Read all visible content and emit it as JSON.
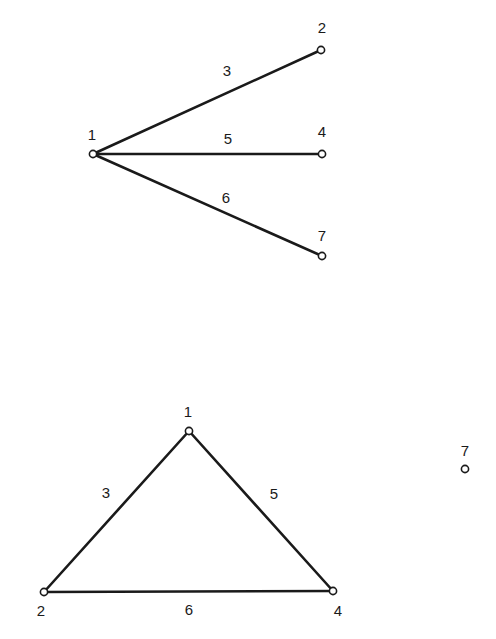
{
  "graphs": [
    {
      "name": "star-graph",
      "nodes": [
        {
          "id": "1",
          "x": 93,
          "y": 154,
          "lx": 92,
          "ly": 140
        },
        {
          "id": "2",
          "x": 321,
          "y": 50,
          "lx": 322,
          "ly": 33
        },
        {
          "id": "4",
          "x": 322,
          "y": 154,
          "lx": 322,
          "ly": 137
        },
        {
          "id": "7",
          "x": 322,
          "y": 256,
          "lx": 322,
          "ly": 241
        }
      ],
      "edges": [
        {
          "label": "3",
          "from": "1",
          "to": "2",
          "lx": 227,
          "ly": 76
        },
        {
          "label": "5",
          "from": "1",
          "to": "4",
          "lx": 228,
          "ly": 144
        },
        {
          "label": "6",
          "from": "1",
          "to": "7",
          "lx": 226,
          "ly": 203
        }
      ]
    },
    {
      "name": "triangle-graph",
      "nodes": [
        {
          "id": "1",
          "x": 189,
          "y": 431,
          "lx": 188,
          "ly": 417
        },
        {
          "id": "2",
          "x": 44,
          "y": 592,
          "lx": 41,
          "ly": 616
        },
        {
          "id": "4",
          "x": 333,
          "y": 591,
          "lx": 338,
          "ly": 616
        },
        {
          "id": "7",
          "x": 465,
          "y": 469,
          "lx": 465,
          "ly": 456
        }
      ],
      "edges": [
        {
          "label": "3",
          "from": "1",
          "to": "2",
          "lx": 106,
          "ly": 498
        },
        {
          "label": "5",
          "from": "1",
          "to": "4",
          "lx": 274,
          "ly": 499
        },
        {
          "label": "6",
          "from": "2",
          "to": "4",
          "lx": 189,
          "ly": 615
        }
      ]
    }
  ]
}
